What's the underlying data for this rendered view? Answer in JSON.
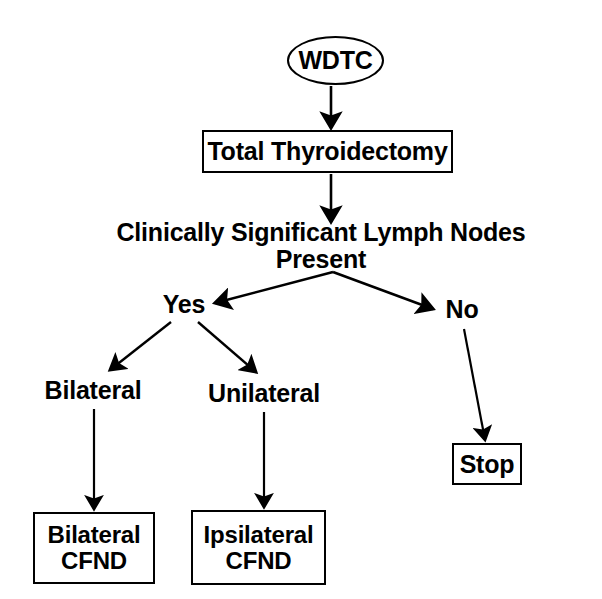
{
  "diagram": {
    "colors": {
      "stroke": "#000000",
      "background": "#ffffff",
      "text": "#000000"
    },
    "nodes": {
      "wdtc": {
        "label": "WDTC",
        "shape": "ellipse"
      },
      "total_thyroidectomy": {
        "label": "Total Thyroidectomy",
        "shape": "rect"
      },
      "clinically_significant": {
        "label": "Clinically Significant Lymph Nodes Present",
        "shape": "plain"
      },
      "yes": {
        "label": "Yes",
        "shape": "plain"
      },
      "no": {
        "label": "No",
        "shape": "plain"
      },
      "bilateral": {
        "label": "Bilateral",
        "shape": "plain"
      },
      "unilateral": {
        "label": "Unilateral",
        "shape": "plain"
      },
      "stop": {
        "label": "Stop",
        "shape": "rect"
      },
      "bilateral_cfnd": {
        "line1": "Bilateral",
        "line2": "CFND",
        "shape": "rect"
      },
      "ipsilateral_cfnd": {
        "line1": "Ipsilateral",
        "line2": "CFND",
        "shape": "rect"
      }
    },
    "edges": [
      {
        "from": "wdtc",
        "to": "total_thyroidectomy",
        "label": ""
      },
      {
        "from": "total_thyroidectomy",
        "to": "clinically_significant",
        "label": ""
      },
      {
        "from": "clinically_significant",
        "to": "yes",
        "label": ""
      },
      {
        "from": "clinically_significant",
        "to": "no",
        "label": ""
      },
      {
        "from": "yes",
        "to": "bilateral",
        "label": ""
      },
      {
        "from": "yes",
        "to": "unilateral",
        "label": ""
      },
      {
        "from": "no",
        "to": "stop",
        "label": ""
      },
      {
        "from": "bilateral",
        "to": "bilateral_cfnd",
        "label": ""
      },
      {
        "from": "unilateral",
        "to": "ipsilateral_cfnd",
        "label": ""
      }
    ]
  }
}
